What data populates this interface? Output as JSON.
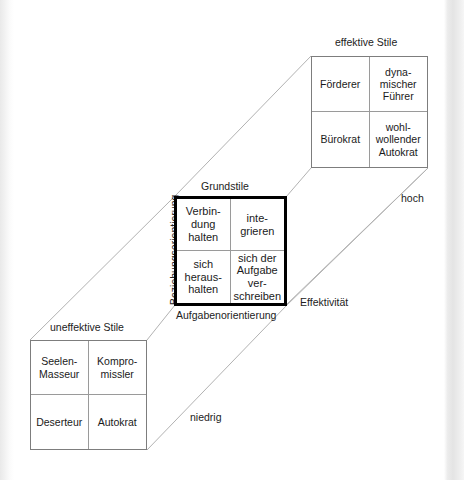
{
  "diagram": {
    "title_effective": "effektive Stile",
    "title_base": "Grundstile",
    "title_ineffective": "uneffektive Stile",
    "axis_x": "Aufgabenorientierung",
    "axis_y": "Beziehungsorientierung",
    "axis_z": "Effektivität",
    "axis_z_high": "hoch",
    "axis_z_low": "niedrig",
    "colors": {
      "ink": "#1a1a1a",
      "thin_border": "#7d7d7d",
      "thick_border": "#000000",
      "connector": "#b0b0b0",
      "page": "#ffffff"
    },
    "grids": {
      "effective": {
        "name": "effektive Stile",
        "cells": [
          "Förderer",
          "dyna-\nmischer\nFührer",
          "Bürokrat",
          "wohl-\nwollender\nAutokrat"
        ]
      },
      "base": {
        "name": "Grundstile",
        "cells": [
          "Verbin-\ndung\nhalten",
          "inte-\ngrieren",
          "sich\nheraus-\nhalten",
          "sich der\nAufgabe\nver-\nschreiben"
        ]
      },
      "ineffective": {
        "name": "uneffektive Stile",
        "cells": [
          "Seelen-\nMasseur",
          "Kompro-\nmissler",
          "Deserteur",
          "Autokrat"
        ]
      }
    }
  }
}
